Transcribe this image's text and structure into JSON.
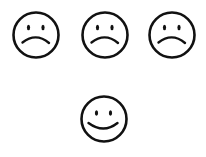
{
  "stroke_color": "#111111",
  "background_color": "#ffffff",
  "faces": [
    {
      "expression": "sad",
      "icon": "sad-face-icon",
      "center": [
        36,
        35
      ]
    },
    {
      "expression": "sad",
      "icon": "sad-face-icon",
      "center": [
        105,
        35
      ]
    },
    {
      "expression": "sad",
      "icon": "sad-face-icon",
      "center": [
        172,
        35
      ]
    },
    {
      "expression": "happy",
      "icon": "happy-face-icon",
      "center": [
        104,
        119
      ]
    }
  ]
}
